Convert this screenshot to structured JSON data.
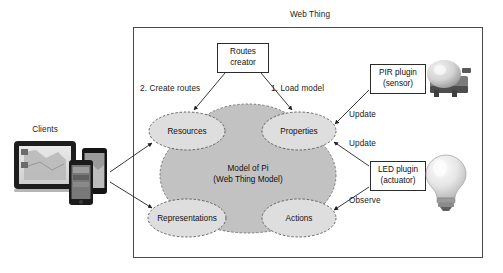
{
  "diagram": {
    "title": "Web Thing",
    "clients_label": "Clients",
    "boxes": [
      {
        "id": "routes-creator",
        "lines": [
          "Routes",
          "creator"
        ]
      },
      {
        "id": "pir-plugin",
        "lines": [
          "PIR plugin",
          "(sensor)"
        ]
      },
      {
        "id": "led-plugin",
        "lines": [
          "LED plugin",
          "(actuator)"
        ]
      }
    ],
    "nodes": [
      {
        "id": "resources",
        "label": "Resources"
      },
      {
        "id": "properties",
        "label": "Properties"
      },
      {
        "id": "representations",
        "label": "Representations"
      },
      {
        "id": "actions",
        "label": "Actions"
      }
    ],
    "model": {
      "line1": "Model of Pi",
      "line2": "(Web Thing Model)"
    },
    "edge_labels": [
      {
        "id": "create-routes",
        "text": "2. Create routes"
      },
      {
        "id": "load-model",
        "text": "1. Load model"
      },
      {
        "id": "update-sensor",
        "text": "Update"
      },
      {
        "id": "update-actuator",
        "text": "Update"
      },
      {
        "id": "observe",
        "text": "Observe"
      }
    ],
    "devices": [
      {
        "id": "tablet-device"
      },
      {
        "id": "phone-device-back"
      },
      {
        "id": "phone-device-front"
      }
    ],
    "hardware": [
      {
        "id": "pir-sensor-photo"
      },
      {
        "id": "led-bulb-photo"
      }
    ],
    "colors": {
      "blob_fill": "#c2c2c2",
      "node_fill": "#dedede",
      "stroke": "#3a3a3a",
      "box_stroke": "#2b2b2b",
      "text": "#111111"
    }
  }
}
